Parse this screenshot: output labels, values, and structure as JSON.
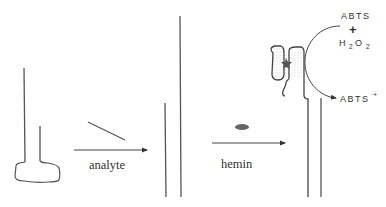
{
  "diagram": {
    "colors": {
      "stroke": "#555555",
      "hemin": "#666666",
      "stipple": "#999999",
      "background": "#ffffff"
    },
    "steps": [
      {
        "id": "probe",
        "label": ""
      },
      {
        "id": "analyte-step",
        "arrow_label": "analyte"
      },
      {
        "id": "hemin-step",
        "arrow_label": "hemin"
      }
    ],
    "reaction": {
      "substrate_1": "ABTS",
      "plus": "+",
      "substrate_2_main": "H",
      "substrate_2_sub1": "2",
      "substrate_2_mid": "O",
      "substrate_2_sub2": "2",
      "product": "ABTS",
      "product_superscript": "·+"
    }
  }
}
